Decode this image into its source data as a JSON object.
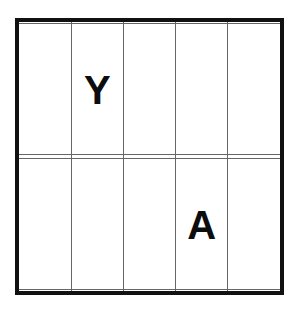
{
  "canvas": {
    "width": 299,
    "height": 313,
    "background_color": "#ffffff"
  },
  "grid": {
    "rows": 5,
    "columns": 5,
    "outer_border_color": "#111111",
    "outer_border_width_px": 4,
    "inner_line_color": "#666666",
    "inner_line_width_px": 1,
    "cell_background_color": "#ffffff",
    "letter_color": "#0d0d0d",
    "cells": [
      [
        {
          "row": 1,
          "col": 1,
          "letter": ""
        },
        {
          "row": 1,
          "col": 2,
          "letter": ""
        },
        {
          "row": 1,
          "col": 3,
          "letter": ""
        },
        {
          "row": 1,
          "col": 4,
          "letter": ""
        },
        {
          "row": 1,
          "col": 5,
          "letter": ""
        }
      ],
      [
        {
          "row": 2,
          "col": 1,
          "letter": ""
        },
        {
          "row": 2,
          "col": 2,
          "letter": "Y"
        },
        {
          "row": 2,
          "col": 3,
          "letter": ""
        },
        {
          "row": 2,
          "col": 4,
          "letter": ""
        },
        {
          "row": 2,
          "col": 5,
          "letter": ""
        }
      ],
      [
        {
          "row": 3,
          "col": 1,
          "letter": ""
        },
        {
          "row": 3,
          "col": 2,
          "letter": ""
        },
        {
          "row": 3,
          "col": 3,
          "letter": ""
        },
        {
          "row": 3,
          "col": 4,
          "letter": ""
        },
        {
          "row": 3,
          "col": 5,
          "letter": ""
        }
      ],
      [
        {
          "row": 4,
          "col": 1,
          "letter": ""
        },
        {
          "row": 4,
          "col": 2,
          "letter": ""
        },
        {
          "row": 4,
          "col": 3,
          "letter": ""
        },
        {
          "row": 4,
          "col": 4,
          "letter": "A"
        },
        {
          "row": 4,
          "col": 5,
          "letter": ""
        }
      ],
      [
        {
          "row": 5,
          "col": 1,
          "letter": ""
        },
        {
          "row": 5,
          "col": 2,
          "letter": ""
        },
        {
          "row": 5,
          "col": 3,
          "letter": ""
        },
        {
          "row": 5,
          "col": 4,
          "letter": ""
        },
        {
          "row": 5,
          "col": 5,
          "letter": ""
        }
      ]
    ],
    "filled_cells": [
      {
        "letter": "Y",
        "row": 2,
        "col": 2
      },
      {
        "letter": "A",
        "row": 4,
        "col": 4
      }
    ]
  }
}
